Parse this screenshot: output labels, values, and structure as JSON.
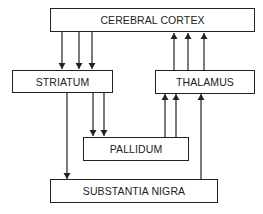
{
  "diagram": {
    "nodes": {
      "cortex": {
        "label": "CEREBRAL CORTEX"
      },
      "striatum": {
        "label": "STRIATUM"
      },
      "thalamus": {
        "label": "THALAMUS"
      },
      "pallidum": {
        "label": "PALLIDUM"
      },
      "nigra": {
        "label": "SUBSTANTIA NIGRA"
      }
    },
    "edges": [
      {
        "from": "CEREBRAL CORTEX",
        "to": "STRIATUM",
        "count": 3
      },
      {
        "from": "THALAMUS",
        "to": "CEREBRAL CORTEX",
        "count": 3
      },
      {
        "from": "STRIATUM",
        "to": "PALLIDUM",
        "count": 2
      },
      {
        "from": "STRIATUM",
        "to": "SUBSTANTIA NIGRA",
        "count": 1
      },
      {
        "from": "PALLIDUM",
        "to": "THALAMUS",
        "count": 2
      },
      {
        "from": "SUBSTANTIA NIGRA",
        "to": "THALAMUS",
        "count": 1
      }
    ],
    "colors": {
      "line": "#222222",
      "background": "#ffffff"
    }
  }
}
